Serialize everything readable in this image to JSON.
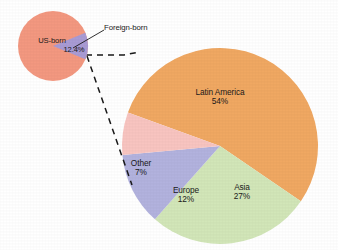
{
  "figure": {
    "background_color": "#ffffff",
    "label_text_color": "#1a1a1a"
  },
  "chart_data": [
    {
      "type": "pie",
      "name": "us-population-nativity",
      "title": "",
      "categories": [
        "US-born",
        "Foreign-born"
      ],
      "values": [
        87.6,
        12.4
      ],
      "labels": [
        "US-born",
        "12.4%"
      ],
      "colors": [
        "#F39880",
        "#A99BD4"
      ],
      "legend": "none",
      "annotations": [
        "Foreign-born"
      ]
    },
    {
      "type": "pie",
      "name": "foreign-born-by-region",
      "title": "",
      "categories": [
        "Latin America",
        "Asia",
        "Europe",
        "Other"
      ],
      "values": [
        54,
        27,
        12,
        7
      ],
      "colors": [
        "#F0A862",
        "#D2E6B8",
        "#B2B2DE",
        "#F8C4C0"
      ],
      "legend": "none",
      "note": "Exploded detail of the 12.4% Foreign-born slice"
    }
  ],
  "small_pie": {
    "slice_us_born_label": "US-born",
    "slice_foreign_born_value": "12.4%",
    "colors": {
      "us_born": "#F39880",
      "foreign_born": "#A99BD4"
    }
  },
  "callout": {
    "label": "Foreign-born"
  },
  "large_pie": {
    "slices": [
      {
        "name": "Latin America",
        "label": "Latin America",
        "percent": "54%",
        "color": "#F0A862"
      },
      {
        "name": "Asia",
        "label": "Asia",
        "percent": "27%",
        "color": "#D2E6B8"
      },
      {
        "name": "Europe",
        "label": "Europe",
        "percent": "12%",
        "color": "#B2B2DE"
      },
      {
        "name": "Other",
        "label": "Other",
        "percent": "7%",
        "color": "#F8C4C0"
      }
    ]
  }
}
